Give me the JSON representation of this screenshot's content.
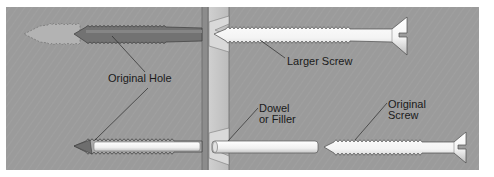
{
  "figure": {
    "background_color": "#9a9a9a",
    "wood_color": "#a5a5a5",
    "stud_color": "#c9c9c9",
    "screw_color": "#f2f2f2",
    "hole_dark_color": "#6f6f6f",
    "hole_light_color": "#b3b3b3"
  },
  "labels": {
    "original_hole": "Original Hole",
    "larger_screw": "Larger Screw",
    "dowel_line1": "Dowel",
    "dowel_line2": "or Filler",
    "original_screw_line1": "Original",
    "original_screw_line2": "Screw"
  },
  "elements": {
    "top_row": [
      "enlarged-hole",
      "original-hole",
      "larger-screw"
    ],
    "bottom_row": [
      "original-hole-with-filler",
      "dowel",
      "original-screw"
    ]
  }
}
